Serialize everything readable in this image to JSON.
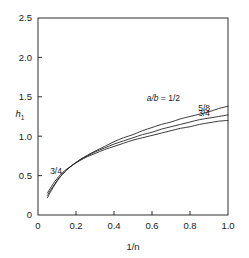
{
  "chart_data": {
    "type": "line",
    "title": "",
    "xlabel": "1/n",
    "ylabel": "h1",
    "ylabel_display": "h",
    "ylabel_sub": "1",
    "xlim": [
      0,
      1.0
    ],
    "ylim": [
      0,
      2.5
    ],
    "xticks": [
      "0",
      "0.2",
      "0.4",
      "0.6",
      "0.8",
      "1.0"
    ],
    "xtick_values": [
      0,
      0.2,
      0.4,
      0.6,
      0.8,
      1.0
    ],
    "yticks": [
      "0",
      "0.5",
      "1.0",
      "1.5",
      "2.0",
      "2.5"
    ],
    "ytick_values": [
      0,
      0.5,
      1.0,
      1.5,
      2.0,
      2.5
    ],
    "grid": false,
    "legend": "inline curve end labels",
    "series": [
      {
        "name": "a/b = 1/2",
        "label": "a/b = 1/2",
        "label_prefix": "a/b",
        "label_eq": " = ",
        "label_value": "1/2",
        "x": [
          0.05,
          0.07,
          0.09,
          0.11,
          0.13,
          0.15,
          0.18,
          0.22,
          0.26,
          0.3,
          0.35,
          0.4,
          0.45,
          0.5,
          0.55,
          0.6,
          0.65,
          0.7,
          0.75,
          0.8,
          0.85,
          0.9,
          0.95,
          1.0
        ],
        "y": [
          0.28,
          0.36,
          0.43,
          0.49,
          0.54,
          0.58,
          0.63,
          0.7,
          0.76,
          0.81,
          0.87,
          0.93,
          0.98,
          1.02,
          1.07,
          1.11,
          1.15,
          1.18,
          1.22,
          1.25,
          1.28,
          1.31,
          1.35,
          1.38
        ]
      },
      {
        "name": "5/8",
        "label": "5/8",
        "x": [
          0.05,
          0.07,
          0.09,
          0.11,
          0.13,
          0.15,
          0.18,
          0.22,
          0.26,
          0.3,
          0.35,
          0.4,
          0.45,
          0.5,
          0.55,
          0.6,
          0.65,
          0.7,
          0.75,
          0.8,
          0.85,
          0.9,
          0.95,
          1.0
        ],
        "y": [
          0.25,
          0.33,
          0.4,
          0.47,
          0.52,
          0.57,
          0.63,
          0.7,
          0.75,
          0.8,
          0.85,
          0.9,
          0.94,
          0.98,
          1.02,
          1.05,
          1.09,
          1.12,
          1.15,
          1.18,
          1.21,
          1.23,
          1.25,
          1.27
        ]
      },
      {
        "name": "3/4",
        "label": "3/4",
        "x": [
          0.05,
          0.07,
          0.09,
          0.11,
          0.13,
          0.15,
          0.18,
          0.22,
          0.26,
          0.3,
          0.35,
          0.4,
          0.45,
          0.5,
          0.55,
          0.6,
          0.65,
          0.7,
          0.75,
          0.8,
          0.85,
          0.9,
          0.95,
          1.0
        ],
        "y": [
          0.22,
          0.31,
          0.39,
          0.46,
          0.52,
          0.57,
          0.63,
          0.69,
          0.74,
          0.78,
          0.83,
          0.87,
          0.91,
          0.95,
          0.98,
          1.01,
          1.04,
          1.07,
          1.1,
          1.12,
          1.15,
          1.17,
          1.19,
          1.2
        ]
      }
    ],
    "annotations": [
      {
        "text": "3/4",
        "x": 0.095,
        "y": 0.52,
        "note": "left-side curve annotation"
      }
    ],
    "colors": {
      "line": "#1a1a1a",
      "axis": "#1a1a1a",
      "background": "#ffffff"
    }
  }
}
